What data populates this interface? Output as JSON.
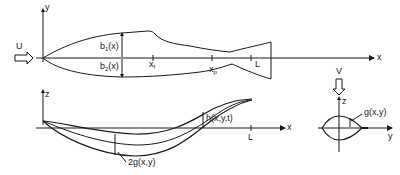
{
  "diagram": {
    "colors": {
      "stroke": "#1a1a1a",
      "background": "#ffffff"
    },
    "top_view": {
      "axis_x": "x",
      "axis_y": "y",
      "flow_label": "U",
      "upper_halfwidth": "b",
      "upper_halfwidth_sub": "1",
      "upper_halfwidth_arg": "(x)",
      "lower_halfwidth": "b",
      "lower_halfwidth_sub": "2",
      "lower_halfwidth_arg": "(x)",
      "fin_point": "x",
      "fin_point_sub": "f",
      "peduncle_point": "x",
      "peduncle_point_sub": "p",
      "length": "L"
    },
    "side_view": {
      "axis_x": "x",
      "axis_z": "z",
      "thickness_label": "2g(x,y)",
      "displacement_label": "h(x,y,t)",
      "length": "L"
    },
    "cross_section": {
      "flow_label": "V",
      "axis_z": "z",
      "axis_y": "y",
      "thickness_label": "g(x,y)"
    }
  }
}
